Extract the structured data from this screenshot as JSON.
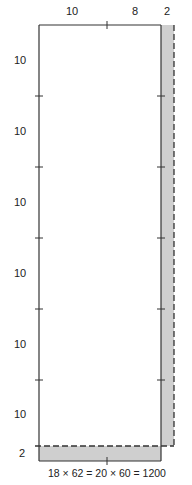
{
  "diagram": {
    "top_labels": [
      "10",
      "8",
      "2"
    ],
    "left_labels": [
      "10",
      "10",
      "10",
      "10",
      "10",
      "10",
      "2"
    ],
    "equation": "18 × 62 = 20 × 60 = 1200",
    "colors": {
      "stroke": "#333333",
      "shade": "#cccccc",
      "background": "#ffffff"
    }
  }
}
